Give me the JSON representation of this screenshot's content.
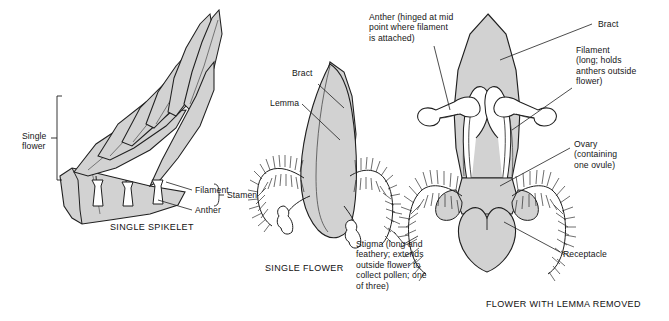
{
  "figure": {
    "background_color": "#ffffff",
    "fill_color": "#d2d2d2",
    "fill_color_light": "#e2e2e2",
    "outline_color": "#1f1f1f",
    "text_color": "#151515"
  },
  "panels": [
    {
      "id": "spikelet",
      "caption": "SINGLE SPIKELET",
      "labels": [
        {
          "key": "single_flower",
          "text": "Single\nflower"
        },
        {
          "key": "filament",
          "text": "Filament"
        },
        {
          "key": "anther",
          "text": "Anther"
        },
        {
          "key": "stamen",
          "text": "Stamen"
        }
      ]
    },
    {
      "id": "single_flower",
      "caption": "SINGLE FLOWER",
      "labels": [
        {
          "key": "bract",
          "text": "Bract"
        },
        {
          "key": "lemma",
          "text": "Lemma"
        },
        {
          "key": "stigma",
          "text": "Stigma (long and\nfeathery; extends\noutside flower to\ncollect pollen; one\nof three)"
        }
      ]
    },
    {
      "id": "flower_lemma_removed",
      "caption": "FLOWER WITH LEMMA REMOVED",
      "labels": [
        {
          "key": "anther",
          "text": "Anther (hinged at mid\npoint where filament\nis attached)"
        },
        {
          "key": "bract",
          "text": "Bract"
        },
        {
          "key": "filament",
          "text": "Filament\n(long; holds\nanthers outside\nflower)"
        },
        {
          "key": "ovary",
          "text": "Ovary\n(containing\none ovule)"
        },
        {
          "key": "receptacle",
          "text": "Receptacle"
        }
      ]
    }
  ],
  "text": {
    "single_flower": "Single\nflower",
    "filament_left": "Filament",
    "anther_left": "Anther",
    "stamen": "Stamen",
    "caption_spikelet": "SINGLE SPIKELET",
    "bract_mid": "Bract",
    "lemma": "Lemma",
    "stigma": "Stigma (long and\nfeathery; extends\noutside flower to\ncollect pollen; one\nof three)",
    "caption_flower": "SINGLE FLOWER",
    "anther_right": "Anther (hinged at mid\npoint where filament\nis attached)",
    "bract_right": "Bract",
    "filament_right": "Filament\n(long; holds\nanthers outside\nflower)",
    "ovary": "Ovary\n(containing\none ovule)",
    "receptacle": "Receptacle",
    "caption_lemma_removed": "FLOWER WITH LEMMA REMOVED"
  }
}
